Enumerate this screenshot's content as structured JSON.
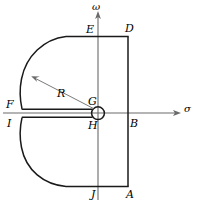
{
  "figure": {
    "axes": {
      "vertical_label": "ω",
      "horizontal_label": "σ"
    },
    "annotations": {
      "radius_label": "R"
    },
    "points": {
      "A": "A",
      "B": "B",
      "D": "D",
      "E": "E",
      "F": "F",
      "G": "G",
      "H": "H",
      "I": "I",
      "J": "J"
    },
    "colors": {
      "stroke": "#1a1a1a",
      "axis": "#555555",
      "background": "#ffffff"
    }
  }
}
